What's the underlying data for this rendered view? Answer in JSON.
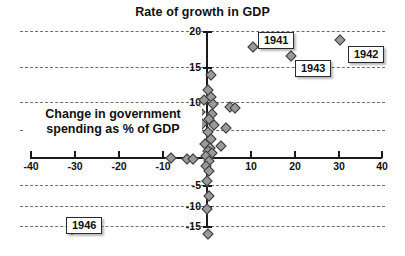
{
  "chart_data": {
    "type": "scatter",
    "title": "Rate of growth in GDP",
    "xlabel": "Change in government spending as % of GDP",
    "ylabel": "Rate of growth in GDP",
    "xlim": [
      -40,
      40
    ],
    "ylim": [
      -15,
      20
    ],
    "xticks": [
      -40,
      -30,
      -20,
      -10,
      0,
      10,
      20,
      30,
      40
    ],
    "yticks": [
      -15,
      -10,
      -5,
      0,
      5,
      10,
      15,
      20
    ],
    "grid": true,
    "legend": "none",
    "points": [
      {
        "x": 10.5,
        "y": 17.5,
        "label": "1941"
      },
      {
        "x": 30.2,
        "y": 18.6,
        "label": "1942"
      },
      {
        "x": 19.2,
        "y": 16.0,
        "label": "1943"
      },
      {
        "x": -30.8,
        "y": -11.5,
        "label": "1946"
      },
      {
        "x": 0.9,
        "y": 13.0,
        "label": ""
      },
      {
        "x": 0.3,
        "y": 10.6,
        "label": ""
      },
      {
        "x": 1.0,
        "y": 9.6,
        "label": ""
      },
      {
        "x": -0.6,
        "y": 9.0,
        "label": ""
      },
      {
        "x": 1.3,
        "y": 8.4,
        "label": ""
      },
      {
        "x": 5.2,
        "y": 8.0,
        "label": ""
      },
      {
        "x": 6.4,
        "y": 7.7,
        "label": ""
      },
      {
        "x": -1.6,
        "y": 7.1,
        "label": ""
      },
      {
        "x": 1.1,
        "y": 6.8,
        "label": ""
      },
      {
        "x": 0.5,
        "y": 6.1,
        "label": ""
      },
      {
        "x": -1.2,
        "y": 5.3,
        "label": ""
      },
      {
        "x": 1.5,
        "y": 5.1,
        "label": ""
      },
      {
        "x": 4.3,
        "y": 4.6,
        "label": ""
      },
      {
        "x": 0.2,
        "y": 3.9,
        "label": ""
      },
      {
        "x": 0.8,
        "y": 2.9,
        "label": ""
      },
      {
        "x": -0.4,
        "y": 2.1,
        "label": ""
      },
      {
        "x": 0.6,
        "y": 1.5,
        "label": ""
      },
      {
        "x": 0.2,
        "y": 1.0,
        "label": ""
      },
      {
        "x": 1.1,
        "y": 0.6,
        "label": ""
      },
      {
        "x": -0.3,
        "y": 0.2,
        "label": ""
      },
      {
        "x": 3.3,
        "y": 1.8,
        "label": ""
      },
      {
        "x": -8.2,
        "y": -0.2,
        "label": ""
      },
      {
        "x": -4.6,
        "y": -0.3,
        "label": ""
      },
      {
        "x": -3.3,
        "y": -0.3,
        "label": ""
      },
      {
        "x": 0.4,
        "y": -0.6,
        "label": ""
      },
      {
        "x": -0.2,
        "y": -1.4,
        "label": ""
      },
      {
        "x": 0.5,
        "y": -2.3,
        "label": ""
      },
      {
        "x": 0.1,
        "y": -3.8,
        "label": ""
      },
      {
        "x": 0.4,
        "y": -6.2,
        "label": ""
      },
      {
        "x": 0.0,
        "y": -8.3,
        "label": ""
      },
      {
        "x": 0.3,
        "y": -12.3,
        "label": ""
      }
    ]
  },
  "axis": {
    "x_tick_labels": [
      "-40",
      "-30",
      "-20",
      "-10",
      "10",
      "20",
      "30",
      "40"
    ],
    "y_tick_labels": [
      "20",
      "15",
      "10",
      "5",
      "-5",
      "-10",
      "-15"
    ],
    "zero_label": "0"
  },
  "callouts": [
    {
      "text": "1941"
    },
    {
      "text": "1942"
    },
    {
      "text": "1943"
    },
    {
      "text": "1946"
    }
  ],
  "colors": {
    "marker_fill": "#9a9a9a",
    "marker_edge": "#3a3a3a",
    "axis": "#1a1a1a",
    "grid": "#555555",
    "background": "#ffffff"
  }
}
